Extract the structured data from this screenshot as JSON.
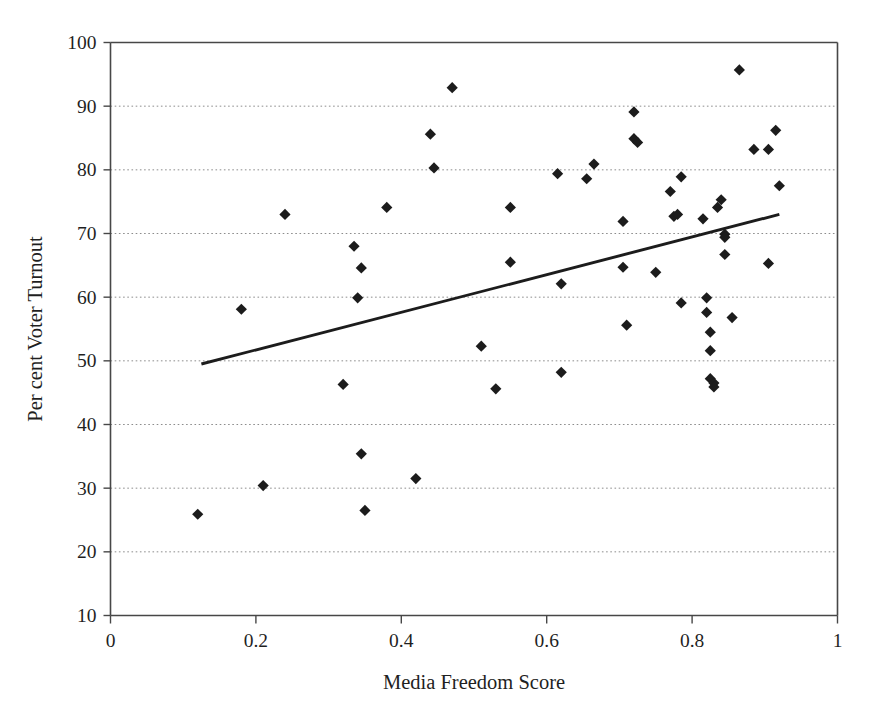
{
  "chart_data": {
    "type": "scatter",
    "title": "",
    "xlabel": "Media Freedom Score",
    "ylabel": "Per cent Voter Turnout",
    "xlim": [
      0,
      1
    ],
    "ylim": [
      10,
      100
    ],
    "xticks": [
      "0",
      "0.2",
      "0.4",
      "0.6",
      "0.8",
      "1"
    ],
    "xtick_values": [
      0,
      0.2,
      0.4,
      0.6,
      0.8,
      1
    ],
    "yticks": [
      "10",
      "20",
      "30",
      "40",
      "50",
      "60",
      "70",
      "80",
      "90",
      "100"
    ],
    "ytick_values": [
      10,
      20,
      30,
      40,
      50,
      60,
      70,
      80,
      90,
      100
    ],
    "grid": "horizontal-dotted",
    "legend": "none",
    "marker_style": "filled-diamond",
    "marker_color": "#1c1c1c",
    "series": [
      {
        "name": "Countries",
        "points": [
          [
            0.12,
            25.9
          ],
          [
            0.18,
            58.1
          ],
          [
            0.21,
            30.4
          ],
          [
            0.24,
            73.0
          ],
          [
            0.32,
            46.3
          ],
          [
            0.335,
            68.0
          ],
          [
            0.34,
            59.9
          ],
          [
            0.345,
            64.6
          ],
          [
            0.345,
            35.4
          ],
          [
            0.35,
            26.5
          ],
          [
            0.38,
            74.1
          ],
          [
            0.42,
            31.5
          ],
          [
            0.44,
            85.6
          ],
          [
            0.445,
            80.3
          ],
          [
            0.47,
            92.9
          ],
          [
            0.51,
            52.3
          ],
          [
            0.53,
            45.6
          ],
          [
            0.55,
            74.1
          ],
          [
            0.55,
            65.5
          ],
          [
            0.615,
            79.4
          ],
          [
            0.62,
            62.1
          ],
          [
            0.62,
            48.2
          ],
          [
            0.655,
            78.6
          ],
          [
            0.665,
            80.9
          ],
          [
            0.705,
            71.9
          ],
          [
            0.705,
            64.7
          ],
          [
            0.71,
            55.6
          ],
          [
            0.72,
            89.1
          ],
          [
            0.72,
            84.9
          ],
          [
            0.725,
            84.3
          ],
          [
            0.75,
            63.9
          ],
          [
            0.77,
            76.6
          ],
          [
            0.775,
            72.7
          ],
          [
            0.78,
            73.0
          ],
          [
            0.785,
            78.9
          ],
          [
            0.785,
            59.1
          ],
          [
            0.815,
            72.3
          ],
          [
            0.82,
            59.9
          ],
          [
            0.82,
            57.6
          ],
          [
            0.825,
            51.6
          ],
          [
            0.825,
            47.2
          ],
          [
            0.825,
            54.5
          ],
          [
            0.83,
            46.5
          ],
          [
            0.83,
            45.9
          ],
          [
            0.835,
            74.1
          ],
          [
            0.84,
            75.3
          ],
          [
            0.845,
            69.9
          ],
          [
            0.845,
            69.4
          ],
          [
            0.845,
            66.7
          ],
          [
            0.855,
            56.8
          ],
          [
            0.865,
            95.7
          ],
          [
            0.885,
            83.2
          ],
          [
            0.905,
            83.2
          ],
          [
            0.905,
            65.3
          ],
          [
            0.915,
            86.2
          ],
          [
            0.92,
            77.5
          ]
        ]
      }
    ],
    "trendline": {
      "type": "linear",
      "x_start": 0.125,
      "y_start": 49.5,
      "x_end": 0.92,
      "y_end": 73.0,
      "color": "#1c1c1c"
    }
  }
}
